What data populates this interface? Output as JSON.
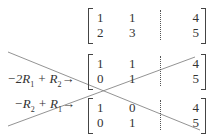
{
  "matrices": [
    {
      "rows": [
        [
          "1",
          "1",
          "4"
        ],
        [
          "2",
          "3",
          "5"
        ]
      ]
    },
    {
      "rows": [
        [
          "1",
          "1",
          "4"
        ],
        [
          "0",
          "1",
          "5"
        ]
      ]
    },
    {
      "rows": [
        [
          "1",
          "0",
          "4"
        ],
        [
          "0",
          "1",
          "5"
        ]
      ]
    }
  ],
  "operations": [
    {
      "a": "−2R",
      "a_sub": "1",
      "plus": "+",
      "b": "R",
      "b_sub": "2",
      "arrow": "→"
    },
    {
      "a": "−R",
      "a_sub": "2",
      "plus": "+",
      "b": "R",
      "b_sub": "1",
      "arrow": "→"
    }
  ],
  "cross_lines": [
    {
      "x1": 8,
      "y1": 52,
      "x2": 200,
      "y2": 130
    },
    {
      "x1": 8,
      "y1": 126,
      "x2": 195,
      "y2": 57
    }
  ]
}
